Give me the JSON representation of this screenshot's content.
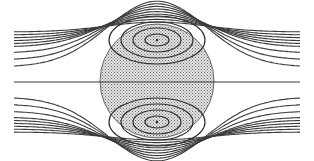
{
  "sphere": {
    "cx": 157,
    "cy": 81,
    "r": 57,
    "fill": "stippled",
    "fill_color": "#bdbdbd",
    "stroke_color": "#4a4a4a"
  },
  "vortices": [
    {
      "name": "upper-vortex",
      "cx": 157,
      "cy": 40,
      "rings": [
        [
          12,
          6
        ],
        [
          24,
          12
        ],
        [
          36,
          18
        ],
        [
          48,
          24
        ]
      ]
    },
    {
      "name": "lower-vortex",
      "cx": 157,
      "cy": 122,
      "rings": [
        [
          12,
          6
        ],
        [
          24,
          12
        ],
        [
          36,
          18
        ],
        [
          48,
          24
        ]
      ]
    }
  ],
  "streamlines": {
    "upper_offsets_left": [
      32,
      35,
      38,
      41,
      44,
      47,
      53,
      60,
      67
    ],
    "center_line_y": 82,
    "lower_offsets_left": [
      97,
      104,
      111,
      117,
      120,
      123,
      126,
      129,
      132
    ],
    "line_color": "#3a3a3a"
  }
}
